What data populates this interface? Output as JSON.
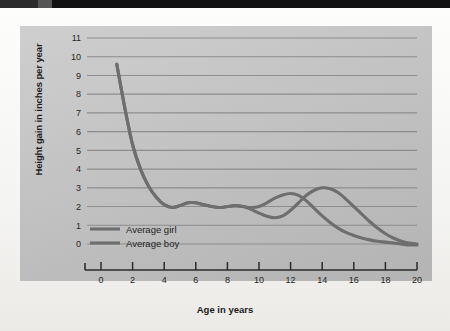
{
  "figure": {
    "panel_color": "#c4c4c4",
    "paper_color": "#f7f7f5",
    "curve_color": "#6e6e6e",
    "grid_color": "#8d8d8d",
    "axis_color": "#2b2b2b"
  },
  "chart_data": {
    "type": "line",
    "title": "",
    "xlabel": "Age in years",
    "ylabel": "Height gain in inches per year",
    "xlim": [
      0,
      20
    ],
    "ylim": [
      0,
      11
    ],
    "xticks": [
      "0",
      "2",
      "4",
      "6",
      "8",
      "10",
      "12",
      "14",
      "16",
      "18",
      "20"
    ],
    "yticks": [
      "0",
      "1",
      "2",
      "3",
      "4",
      "5",
      "6",
      "7",
      "8",
      "9",
      "10",
      "11"
    ],
    "grid": "horizontal",
    "legend_position": "inside-lower-left",
    "series": [
      {
        "name": "Average girl",
        "color": "#6e6e6e",
        "x": [
          1.0,
          1.5,
          2.0,
          2.5,
          3.0,
          3.5,
          4.0,
          4.5,
          5.0,
          5.5,
          6.0,
          6.5,
          7.0,
          7.5,
          8.0,
          8.5,
          9.0,
          9.5,
          10.0,
          10.5,
          11.0,
          11.5,
          12.0,
          12.5,
          13.0,
          13.5,
          14.0,
          14.5,
          15.0,
          15.5,
          16.0,
          16.5,
          17.0,
          17.5,
          18.0,
          18.5,
          19.0,
          19.5,
          20.0
        ],
        "y": [
          9.6,
          7.3,
          5.3,
          4.0,
          3.1,
          2.5,
          2.1,
          1.95,
          2.05,
          2.2,
          2.2,
          2.1,
          2.0,
          1.95,
          2.0,
          2.05,
          2.0,
          1.95,
          2.0,
          2.2,
          2.45,
          2.62,
          2.7,
          2.6,
          2.3,
          1.9,
          1.5,
          1.15,
          0.85,
          0.62,
          0.45,
          0.32,
          0.22,
          0.15,
          0.1,
          0.05,
          0.0,
          -0.05,
          -0.05
        ]
      },
      {
        "name": "Average boy",
        "color": "#6e6e6e",
        "x": [
          1.0,
          1.5,
          2.0,
          2.5,
          3.0,
          3.5,
          4.0,
          4.5,
          5.0,
          5.5,
          6.0,
          6.5,
          7.0,
          7.5,
          8.0,
          8.5,
          9.0,
          9.5,
          10.0,
          10.5,
          11.0,
          11.5,
          12.0,
          12.5,
          13.0,
          13.5,
          14.0,
          14.5,
          15.0,
          15.5,
          16.0,
          16.5,
          17.0,
          17.5,
          18.0,
          18.5,
          19.0,
          19.5,
          20.0
        ],
        "y": [
          9.6,
          7.3,
          5.3,
          4.0,
          3.1,
          2.5,
          2.1,
          1.95,
          2.05,
          2.2,
          2.2,
          2.1,
          2.0,
          1.95,
          2.0,
          2.05,
          2.0,
          1.85,
          1.65,
          1.48,
          1.4,
          1.5,
          1.8,
          2.2,
          2.6,
          2.87,
          3.0,
          2.95,
          2.75,
          2.4,
          2.0,
          1.6,
          1.2,
          0.85,
          0.55,
          0.32,
          0.15,
          0.05,
          0.0
        ]
      }
    ],
    "annotations": {
      "girl_peak_age": 12,
      "girl_peak_value": 2.7,
      "boy_peak_age": 14,
      "boy_peak_value": 3.0,
      "boy_dip_age": 11,
      "boy_dip_value": 1.4,
      "infant_start_age": 1,
      "infant_start_value": 9.6,
      "crossover_age": 13
    }
  },
  "legend": {
    "items": [
      {
        "label": "Average girl",
        "color": "#6e6e6e"
      },
      {
        "label": "Average boy",
        "color": "#6e6e6e"
      }
    ]
  }
}
